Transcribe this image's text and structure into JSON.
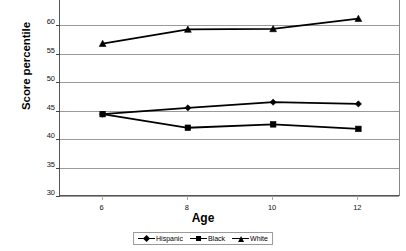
{
  "chart_data": {
    "type": "line",
    "title": "",
    "xlabel": "Age",
    "ylabel": "Score percentile",
    "x": [
      6,
      8,
      10,
      12
    ],
    "xticklabels": [
      "6",
      "8",
      "10",
      "12"
    ],
    "xlim": [
      5,
      13
    ],
    "ylim": [
      30,
      65
    ],
    "yticks": [
      30,
      35,
      40,
      45,
      50,
      55,
      60,
      65
    ],
    "yticklabels": [
      "30",
      "35",
      "40",
      "45",
      "50",
      "55",
      "60",
      "65"
    ],
    "grid": "horizontal",
    "legend_position": "bottom-center",
    "series": [
      {
        "name": "Hispanic",
        "marker": "diamond",
        "color": "#000000",
        "values": [
          44.4,
          45.5,
          46.5,
          46.2
        ]
      },
      {
        "name": "Black",
        "marker": "square",
        "color": "#000000",
        "values": [
          44.4,
          42.0,
          42.6,
          41.8
        ]
      },
      {
        "name": "White",
        "marker": "triangle",
        "color": "#000000",
        "values": [
          56.8,
          59.3,
          59.4,
          61.2
        ]
      }
    ]
  },
  "axes": {
    "y_title": "Score percentile",
    "x_title": "Age"
  },
  "legend": {
    "items": [
      {
        "label": "Hispanic",
        "marker": "diamond-icon"
      },
      {
        "label": "Black",
        "marker": "square-icon"
      },
      {
        "label": "White",
        "marker": "triangle-icon"
      }
    ]
  },
  "colors": {
    "line": "#000000",
    "grid": "#9a9a9a",
    "axis": "#555555",
    "background": "#ffffff"
  }
}
